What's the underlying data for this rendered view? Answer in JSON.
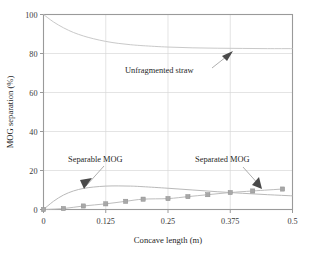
{
  "chart_data": {
    "type": "line",
    "title": "",
    "xlabel": "Concave length (m)",
    "ylabel": "MOG separation (%)",
    "xlim": [
      0,
      0.5
    ],
    "ylim": [
      0,
      100
    ],
    "xticks": [
      "0",
      "0.125",
      "0.25",
      "0.375",
      "0.5"
    ],
    "xtick_values": [
      0,
      0.125,
      0.25,
      0.375,
      0.5
    ],
    "yticks": [
      "0",
      "20",
      "40",
      "60",
      "80",
      "100"
    ],
    "ytick_values": [
      0,
      20,
      40,
      60,
      80,
      100
    ],
    "grid": true,
    "legend": "none",
    "annotations": [
      {
        "text": "Unfragmented straw",
        "points_to_series": "Unfragmented straw",
        "x": 0.36,
        "y": 82.5
      },
      {
        "text": "Separable MOG",
        "points_to_series": "Separable MOG",
        "x": 0.075,
        "y": 11.0
      },
      {
        "text": "Separated MOG",
        "points_to_series": "Separated MOG",
        "x": 0.425,
        "y": 9.8
      }
    ],
    "series": [
      {
        "name": "Unfragmented straw",
        "style": "line",
        "x": [
          0,
          0.02,
          0.04,
          0.06,
          0.08,
          0.1,
          0.125,
          0.15,
          0.175,
          0.2,
          0.25,
          0.3,
          0.35,
          0.4,
          0.45,
          0.5
        ],
        "values": [
          100.0,
          96.2,
          93.2,
          90.8,
          89.0,
          87.6,
          86.2,
          85.2,
          84.5,
          84.0,
          83.3,
          82.9,
          82.7,
          82.6,
          82.5,
          82.5
        ]
      },
      {
        "name": "Separable MOG",
        "style": "line",
        "x": [
          0,
          0.02,
          0.04,
          0.06,
          0.08,
          0.1,
          0.125,
          0.15,
          0.175,
          0.2,
          0.25,
          0.3,
          0.35,
          0.4,
          0.45,
          0.5
        ],
        "values": [
          0.0,
          4.2,
          7.4,
          9.5,
          10.8,
          11.5,
          12.0,
          12.1,
          12.0,
          11.7,
          10.9,
          10.0,
          9.1,
          8.3,
          7.6,
          7.0
        ]
      },
      {
        "name": "Separated MOG",
        "style": "line+markers",
        "marker": "square",
        "x": [
          0,
          0.04,
          0.08,
          0.125,
          0.165,
          0.2,
          0.25,
          0.29,
          0.33,
          0.375,
          0.42,
          0.48
        ],
        "values": [
          0.0,
          0.5,
          1.8,
          2.9,
          4.2,
          5.3,
          5.6,
          6.6,
          7.6,
          8.7,
          9.5,
          10.5
        ]
      }
    ]
  }
}
